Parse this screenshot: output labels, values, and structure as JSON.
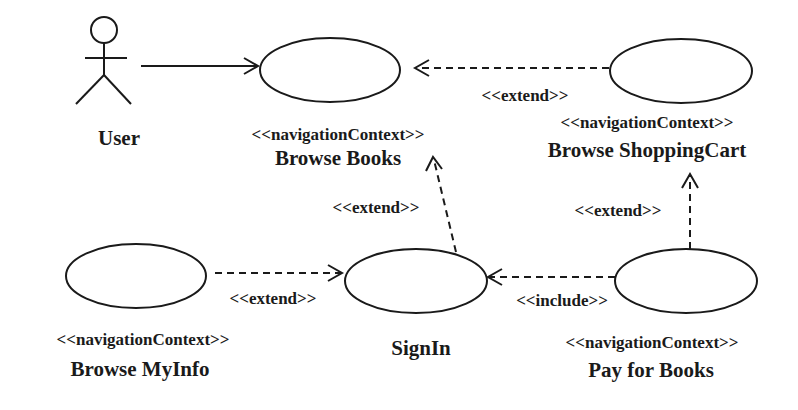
{
  "diagram": {
    "type": "use-case",
    "actor": {
      "name": "User"
    },
    "use_cases": {
      "browse_books": {
        "stereotype": "<<navigationContext>>",
        "name": "Browse Books"
      },
      "browse_shopping_cart": {
        "stereotype": "<<navigationContext>>",
        "name": "Browse ShoppingCart"
      },
      "browse_myinfo": {
        "stereotype": "<<navigationContext>>",
        "name": "Browse MyInfo"
      },
      "signin": {
        "stereotype": "",
        "name": "SignIn"
      },
      "pay_for_books": {
        "stereotype": "<<navigationContext>>",
        "name": "Pay for Books"
      }
    },
    "relations": [
      {
        "from": "User",
        "to": "Browse Books",
        "kind": "association",
        "label": ""
      },
      {
        "from": "Browse ShoppingCart",
        "to": "Browse Books",
        "kind": "dependency",
        "label": "<<extend>>"
      },
      {
        "from": "SignIn",
        "to": "Browse Books",
        "kind": "dependency",
        "label": "<<extend>>"
      },
      {
        "from": "Pay for Books",
        "to": "Browse ShoppingCart",
        "kind": "dependency",
        "label": "<<extend>>"
      },
      {
        "from": "Browse MyInfo",
        "to": "SignIn",
        "kind": "dependency",
        "label": "<<extend>>"
      },
      {
        "from": "Pay for Books",
        "to": "SignIn",
        "kind": "dependency",
        "label": "<<include>>"
      }
    ]
  }
}
